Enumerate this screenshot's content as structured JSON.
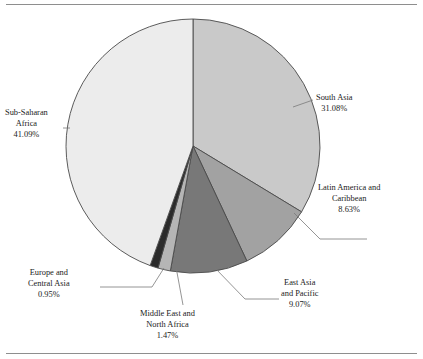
{
  "figure": {
    "type": "pie-chart-figure",
    "background": "#ffffff",
    "rule_color": "#8e8e8e"
  },
  "chart_data": {
    "type": "pie",
    "title": "",
    "subtitle": "",
    "xlabel": "",
    "ylabel": "",
    "legend_position": "none",
    "grid": false,
    "label_format": "name + percent",
    "start_angle_deg": 0,
    "direction": "clockwise",
    "categories": [
      "South Asia",
      "Latin America and Caribbean",
      "East Asia and Pacific",
      "Middle East and North Africa",
      "Europe and Central Asia",
      "Sub-Saharan Africa"
    ],
    "values": [
      31.08,
      8.63,
      9.07,
      1.47,
      0.95,
      41.09
    ],
    "value_labels": [
      "31.08%",
      "8.63%",
      "9.07%",
      "1.47%",
      "0.95%",
      "41.09%"
    ],
    "colors": [
      "#c9c9c9",
      "#a2a2a2",
      "#787878",
      "#b5b5b5",
      "#2b2b2b",
      "#ececec"
    ],
    "slice_outline": "#4a4a4a",
    "total": 100.29
  },
  "slices": [
    {
      "name": "South Asia",
      "percent_label": "31.08%",
      "color": "#c9c9c9",
      "label_lines": [
        "South Asia",
        "31.08%"
      ]
    },
    {
      "name": "Latin America and Caribbean",
      "percent_label": "8.63%",
      "color": "#a2a2a2",
      "label_lines": [
        "Latin America and",
        "Caribbean",
        "8.63%"
      ]
    },
    {
      "name": "East Asia and Pacific",
      "percent_label": "9.07%",
      "color": "#787878",
      "label_lines": [
        "East Asia",
        "and Pacific",
        "9.07%"
      ]
    },
    {
      "name": "Middle East and North Africa",
      "percent_label": "1.47%",
      "color": "#b5b5b5",
      "label_lines": [
        "Middle East and",
        "North Africa",
        "1.47%"
      ]
    },
    {
      "name": "Europe and Central Asia",
      "percent_label": "0.95%",
      "color": "#2b2b2b",
      "label_lines": [
        "Europe and",
        "Central Asia",
        "0.95%"
      ]
    },
    {
      "name": "Sub-Saharan Africa",
      "percent_label": "41.09%",
      "color": "#ececec",
      "label_lines": [
        "Sub-Saharan",
        "Africa",
        "41.09%"
      ]
    }
  ],
  "labels": {
    "south_asia": {
      "l1": "South Asia",
      "l2": "31.08%"
    },
    "latin_america": {
      "l1": "Latin America and",
      "l2": "Caribbean",
      "l3": "8.63%"
    },
    "east_asia": {
      "l1": "East Asia",
      "l2": "and Pacific",
      "l3": "9.07%"
    },
    "middle_east": {
      "l1": "Middle East and",
      "l2": "North Africa",
      "l3": "1.47%"
    },
    "europe": {
      "l1": "Europe and",
      "l2": "Central Asia",
      "l3": "0.95%"
    },
    "sub_saharan": {
      "l1": "Sub-Saharan",
      "l2": "Africa",
      "l3": "41.09%"
    }
  }
}
